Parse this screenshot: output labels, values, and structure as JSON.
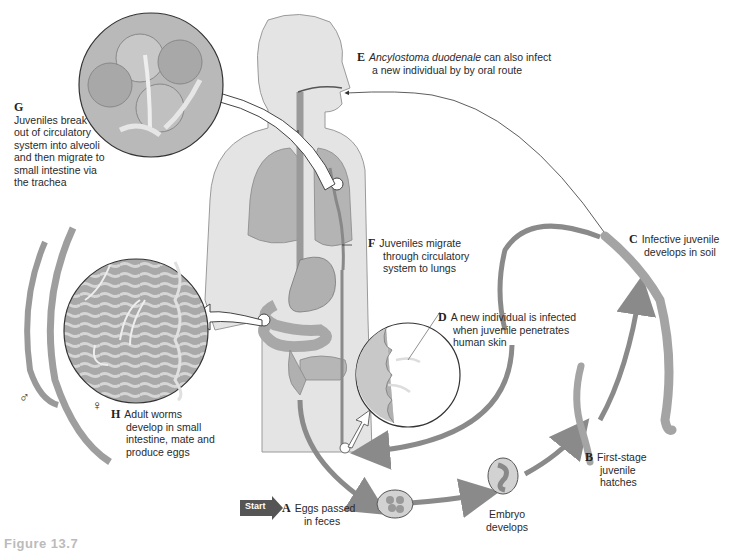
{
  "diagram": {
    "stages": [
      {
        "id": "A",
        "letter": "A",
        "lines": [
          "Eggs passed",
          "in feces"
        ]
      },
      {
        "id": "B",
        "letter": "B",
        "lines": [
          "First-stage",
          "juvenile",
          "hatches"
        ]
      },
      {
        "id": "C",
        "letter": "C",
        "lines": [
          "Infective juvenile",
          "develops in soil"
        ]
      },
      {
        "id": "D",
        "letter": "D",
        "lines": [
          "A new individual is infected",
          "when juvenile penetrates",
          "human skin"
        ]
      },
      {
        "id": "E",
        "letter": "E",
        "italic": "Ancylostoma duodenale",
        "lines": [
          " can also infect",
          "a new individual by by oral route"
        ]
      },
      {
        "id": "F",
        "letter": "F",
        "lines": [
          "Juveniles migrate",
          "through circulatory",
          "system to lungs"
        ]
      },
      {
        "id": "G",
        "letter": "G",
        "lines": [
          "Juveniles break",
          "out of circulatory",
          "system into alveoli",
          "and then migrate to",
          "small intestine via",
          "the trachea"
        ]
      },
      {
        "id": "H",
        "letter": "H",
        "lines": [
          "Adult worms",
          "develop in small",
          "intestine, mate and",
          "produce eggs"
        ]
      }
    ],
    "embryo_label": [
      "Embryo",
      "develops"
    ],
    "start_label": "Start",
    "sex_symbols": {
      "male": "♂",
      "female": "♀"
    },
    "caption_fragment": "Figure 13.7",
    "colors": {
      "arrow": "#8a8a8a",
      "body": "#e4e4e4",
      "organ": "#bdbdbd",
      "start_badge": "#555555",
      "outline": "#333333"
    }
  }
}
